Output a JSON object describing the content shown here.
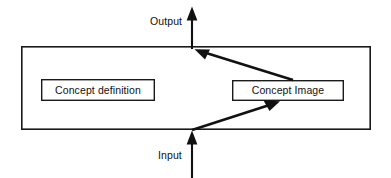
{
  "diagram": {
    "title_present": false,
    "background_color": "#ffffff",
    "stroke_color": "#1a1a1a",
    "text_color": "#101010",
    "container": {
      "name": "system-boundary",
      "x": 21,
      "y": 46,
      "width": 350,
      "height": 84,
      "stroke_width": 1.6
    },
    "nodes": [
      {
        "id": "concept-definition",
        "label": "Concept definition",
        "x": 41,
        "y": 79,
        "width": 114,
        "height": 22,
        "stroke_width": 1.4
      },
      {
        "id": "concept-image",
        "label": "Concept Image",
        "x": 232,
        "y": 80,
        "width": 112,
        "height": 21,
        "stroke_width": 1.4
      }
    ],
    "flows": [
      {
        "id": "output-arrow",
        "label": "Output",
        "label_x": 150,
        "label_y": 22,
        "direction": "up",
        "shaft_x": 192,
        "from_y": 48,
        "to_y": 7
      },
      {
        "id": "input-arrow",
        "label": "Input",
        "label_x": 158,
        "label_y": 156,
        "direction": "up",
        "shaft_x": 192,
        "from_y": 178,
        "to_y": 131
      }
    ],
    "connectors": [
      {
        "id": "concept-image-to-output",
        "from": "concept-image",
        "to": "output-arrow",
        "x1": 293,
        "y1": 80,
        "x2": 196,
        "y2": 50,
        "arrowhead": "end"
      },
      {
        "id": "input-to-concept-image",
        "from": "input-arrow",
        "to": "concept-image",
        "x1": 192,
        "y1": 130,
        "x2": 279,
        "y2": 102,
        "arrowhead": "end"
      }
    ]
  }
}
